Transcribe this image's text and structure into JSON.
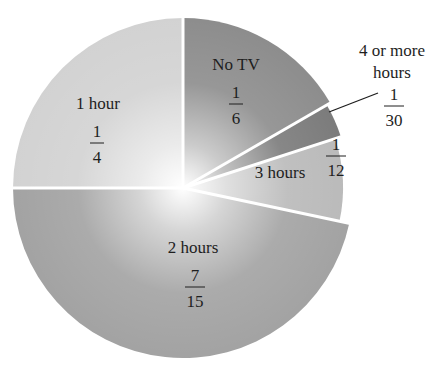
{
  "chart_data": {
    "type": "pie",
    "title": "",
    "center": [
      183,
      188
    ],
    "radius": 170,
    "start_angle_deg": -90,
    "slices": [
      {
        "label": "No TV",
        "fraction": "1/6",
        "numerator": "1",
        "denominator": "6",
        "value": 0.1667,
        "color": "#8c8c8c"
      },
      {
        "label": "4 or more hours",
        "label_lines": [
          "4 or more",
          "hours"
        ],
        "fraction": "1/30",
        "numerator": "1",
        "denominator": "30",
        "value": 0.0333,
        "color": "#7a7a7a"
      },
      {
        "label": "3 hours",
        "fraction": "1/12",
        "numerator": "1",
        "denominator": "12",
        "value": 0.0833,
        "color": "#b9b9b9"
      },
      {
        "label": "2 hours",
        "fraction": "7/15",
        "numerator": "7",
        "denominator": "15",
        "value": 0.4667,
        "color": "#a2a2a2"
      },
      {
        "label": "1 hour",
        "fraction": "1/4",
        "numerator": "1",
        "denominator": "4",
        "value": 0.25,
        "color": "#d2d2d2"
      }
    ],
    "legend": "none",
    "grid": false
  },
  "labels": {
    "no_tv": {
      "name": "No TV",
      "num": "1",
      "den": "6"
    },
    "four_plus": {
      "line1": "4 or more",
      "line2": "hours",
      "num": "1",
      "den": "30"
    },
    "three": {
      "name": "3 hours",
      "num": "1",
      "den": "12"
    },
    "two": {
      "name": "2 hours",
      "num": "7",
      "den": "15"
    },
    "one": {
      "name": "1 hour",
      "num": "1",
      "den": "4"
    }
  }
}
